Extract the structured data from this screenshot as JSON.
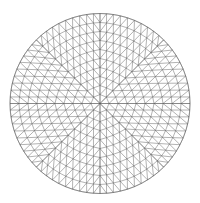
{
  "figure": {
    "background": "#ffffff",
    "line_color": "#555555",
    "line_width": 0.45,
    "node_color": "#333333",
    "disc": {
      "cx": 100,
      "cy": 103.5,
      "r": 90
    },
    "mesh": {
      "rings": 10,
      "pattern": "radial triangulation with 8-fold symmetry"
    }
  }
}
